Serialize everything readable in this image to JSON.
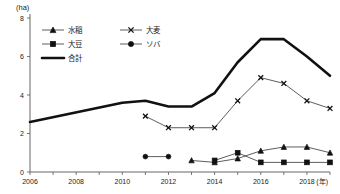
{
  "chart_data": {
    "type": "line",
    "title": "",
    "xlabel": "(年)",
    "ylabel": "(ha)",
    "yunit": "(ha)",
    "xunit": "(年)",
    "xlim": [
      2006,
      2019
    ],
    "ylim": [
      0,
      8
    ],
    "ytick_labels": [
      "0",
      "2",
      "4",
      "6",
      "8"
    ],
    "ytick_values": [
      0,
      2,
      4,
      6,
      8
    ],
    "xtick_labels": [
      "2006",
      "2008",
      "2010",
      "2012",
      "2014",
      "2016",
      "2018"
    ],
    "xtick_values": [
      2006,
      2008,
      2010,
      2012,
      2014,
      2016,
      2018
    ],
    "x_minor_ticks": [
      2006,
      2007,
      2008,
      2009,
      2010,
      2011,
      2012,
      2013,
      2014,
      2015,
      2016,
      2017,
      2018,
      2019
    ],
    "grid": false,
    "legend_position": "top-left",
    "series": [
      {
        "name": "水稲",
        "marker": "triangle",
        "line": "thin",
        "x": [
          2013,
          2014,
          2015,
          2016,
          2017,
          2018,
          2019
        ],
        "values": [
          0.6,
          0.5,
          0.7,
          1.1,
          1.3,
          1.3,
          1.0
        ]
      },
      {
        "name": "大麦",
        "marker": "x",
        "line": "thin",
        "x": [
          2011,
          2012,
          2013,
          2014,
          2015,
          2016,
          2017,
          2018,
          2019
        ],
        "values": [
          2.9,
          2.3,
          2.3,
          2.3,
          3.7,
          4.9,
          4.6,
          3.7,
          3.3
        ]
      },
      {
        "name": "大豆",
        "marker": "square",
        "line": "thin",
        "x": [
          2014,
          2015,
          2016,
          2017,
          2018,
          2019
        ],
        "values": [
          0.6,
          1.0,
          0.5,
          0.5,
          0.5,
          0.5
        ]
      },
      {
        "name": "ソバ",
        "marker": "circle",
        "line": "thin",
        "x": [
          2011,
          2012
        ],
        "values": [
          0.8,
          0.8
        ]
      },
      {
        "name": "合計",
        "marker": "none",
        "line": "thick",
        "x": [
          2006,
          2010,
          2011,
          2012,
          2013,
          2014,
          2015,
          2016,
          2017,
          2018,
          2019
        ],
        "values": [
          2.6,
          3.6,
          3.7,
          3.4,
          3.4,
          4.1,
          5.7,
          6.9,
          6.9,
          6.0,
          5.0
        ]
      }
    ],
    "legend": [
      {
        "label": "水稲",
        "marker": "triangle",
        "line": "thin"
      },
      {
        "label": "大麦",
        "marker": "x",
        "line": "thin"
      },
      {
        "label": "大豆",
        "marker": "square",
        "line": "thin"
      },
      {
        "label": "ソバ",
        "marker": "circle",
        "line": "thin"
      },
      {
        "label": "合計",
        "marker": "none",
        "line": "thick"
      }
    ],
    "colors": {
      "line": "#111111",
      "axis": "#555555",
      "text": "#1a1a1a",
      "background": "#ffffff"
    }
  }
}
